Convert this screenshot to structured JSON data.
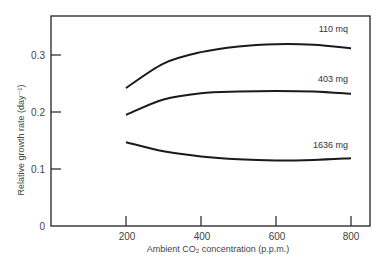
{
  "chart_data": {
    "type": "line",
    "title": "",
    "xlabel": "Ambient CO₂ concentration (p.p.m.)",
    "ylabel": "Relative growth rate (day⁻¹)",
    "xlim": [
      0,
      850
    ],
    "ylim": [
      0,
      0.37
    ],
    "x_ticks": [
      200,
      400,
      600,
      800
    ],
    "y_ticks": [
      0,
      0.1,
      0.2,
      0.3
    ],
    "x_tick_labels": [
      "200",
      "400",
      "600",
      "800"
    ],
    "y_tick_labels": [
      "0",
      "0.1",
      "0.2",
      "0.3"
    ],
    "grid": false,
    "legend": "inline labels at right end of each curve",
    "x": [
      200,
      300,
      400,
      500,
      600,
      700,
      800
    ],
    "series": [
      {
        "name": "110 mq",
        "values": [
          0.242,
          0.285,
          0.305,
          0.315,
          0.319,
          0.318,
          0.312
        ]
      },
      {
        "name": "403 mg",
        "values": [
          0.195,
          0.222,
          0.233,
          0.236,
          0.237,
          0.236,
          0.232
        ]
      },
      {
        "name": "1636 mg",
        "values": [
          0.147,
          0.131,
          0.122,
          0.117,
          0.115,
          0.116,
          0.119
        ]
      }
    ]
  }
}
